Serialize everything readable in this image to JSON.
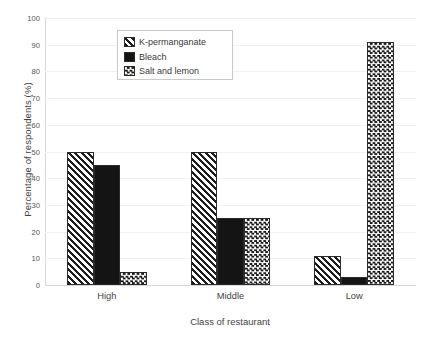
{
  "chart_data": {
    "type": "bar",
    "title": "",
    "xlabel": "Class of restaurant",
    "ylabel": "Percentage of respondents (%)",
    "categories": [
      "High",
      "Middle",
      "Low"
    ],
    "series": [
      {
        "name": "K-permanganate",
        "pattern": "diagonal-hatch",
        "values": [
          50,
          50,
          11
        ]
      },
      {
        "name": "Bleach",
        "pattern": "solid-black",
        "values": [
          45,
          25,
          3
        ]
      },
      {
        "name": "Salt and lemon",
        "pattern": "checkerboard",
        "values": [
          5,
          25,
          91
        ]
      }
    ],
    "ylim": [
      0,
      100
    ],
    "yticks": [
      0,
      10,
      20,
      30,
      40,
      50,
      60,
      70,
      80,
      90,
      100
    ],
    "grid": "horizontal",
    "legend_position": "upper-left-inside",
    "colors": {
      "ink": "#1d1d1d",
      "grid": "#f1f1f1",
      "axis": "#d8d8d8",
      "background": "#ffffff",
      "text": "#3f3f3f"
    }
  }
}
